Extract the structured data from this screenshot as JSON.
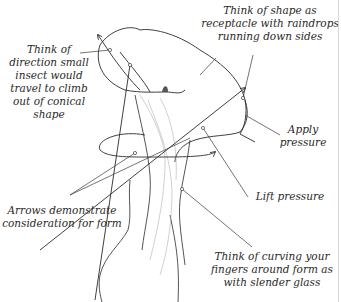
{
  "diagram": {
    "colors": {
      "background": "#ffffff",
      "ink": "#2a2a2a",
      "light_ink": "#9a9a9a"
    },
    "annotations": [
      {
        "id": "insect",
        "lines": [
          "Think of",
          "direction small",
          "insect would",
          "travel to climb",
          "out of conical",
          "shape"
        ]
      },
      {
        "id": "raindrops",
        "lines": [
          "Think of shape as",
          "receptacle with raindrops",
          "running down sides"
        ]
      },
      {
        "id": "apply-pressure",
        "lines": [
          "Apply",
          "pressure"
        ]
      },
      {
        "id": "arrows",
        "lines": [
          "Arrows demonstrate",
          "consideration for form"
        ]
      },
      {
        "id": "lift-pressure",
        "lines": [
          "Lift pressure"
        ]
      },
      {
        "id": "curving-fingers",
        "lines": [
          "Think of curving your",
          "fingers around form as",
          "with slender glass"
        ]
      }
    ]
  }
}
